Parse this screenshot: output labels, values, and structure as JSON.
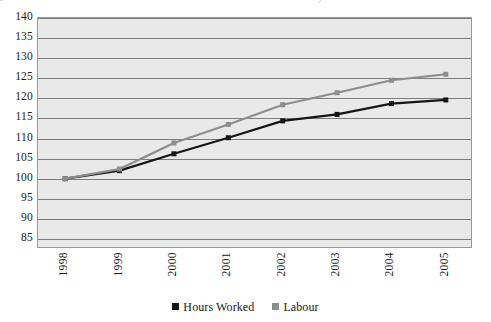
{
  "figure": {
    "cropped_caption_left": "F",
    "cropped_caption_right": "y"
  },
  "legend": {
    "position": "bottom-center",
    "entries": [
      {
        "label": "Hours Worked",
        "color": "#151515"
      },
      {
        "label": "Labour",
        "color": "#8d8d8d"
      }
    ]
  },
  "axes": {
    "y_ticks": [
      "140",
      "135",
      "130",
      "125",
      "120",
      "115",
      "110",
      "105",
      "100",
      "95",
      "90",
      "85"
    ],
    "x_ticks": [
      "1998",
      "1999",
      "2000",
      "2001",
      "2002",
      "2003",
      "2004",
      "2005"
    ]
  },
  "chart_data": {
    "type": "line",
    "title": "",
    "subtitle": "",
    "xlabel": "",
    "ylabel": "",
    "categories": [
      "1998",
      "1999",
      "2000",
      "2001",
      "2002",
      "2003",
      "2004",
      "2005"
    ],
    "x": [
      1998,
      1999,
      2000,
      2001,
      2002,
      2003,
      2004,
      2005
    ],
    "series": [
      {
        "name": "Hours Worked",
        "color": "#151515",
        "marker": "square",
        "values": [
          100.0,
          102.0,
          106.2,
          110.2,
          114.4,
          116.0,
          118.7,
          119.6
        ]
      },
      {
        "name": "Labour",
        "color": "#8d8d8d",
        "marker": "square",
        "values": [
          100.0,
          102.4,
          108.9,
          113.5,
          118.4,
          121.4,
          124.5,
          126.0
        ]
      }
    ],
    "ylim": [
      82.5,
      140
    ],
    "ytick_step": 5,
    "grid": true,
    "grid_axis": "y",
    "legend_position": "bottom-center",
    "plot_background": "#e9e9e9",
    "gridline_color": "#7d7d7d"
  }
}
